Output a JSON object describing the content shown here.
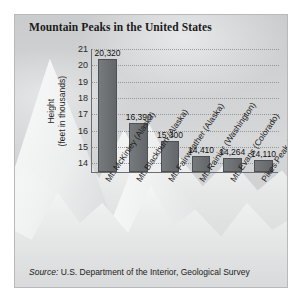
{
  "chart_data": {
    "type": "bar",
    "title": "Mountain Peaks in the United States",
    "xlabel": "",
    "ylabel_lines": [
      "Height",
      "(feet in thousands)"
    ],
    "ylim": [
      13.4,
      21
    ],
    "yticks": [
      14,
      15,
      16,
      17,
      18,
      19,
      20,
      21
    ],
    "ytick_labels": [
      "14",
      "15",
      "16",
      "17",
      "18",
      "19",
      "20",
      "21"
    ],
    "grid": true,
    "legend": null,
    "categories": [
      "Mt. McKinley (Alaska)",
      "Mt. Blackburn (Alaska)",
      "Mt. Fairweather (Alaska)",
      "Mt. Rainier (Washington)",
      "Mt. Evans (Colorado)",
      "Pikes Peak (Colorado)"
    ],
    "values": [
      20320,
      16390,
      15300,
      14410,
      14264,
      14110
    ],
    "value_labels": [
      "20,320",
      "16,390",
      "15,300",
      "14,410",
      "14,264",
      "14,110"
    ],
    "bar_color": "#6f7274"
  },
  "footer": {
    "source_prefix": "Source:",
    "source_text": " U.S. Department of the Interior, Geological Survey"
  }
}
